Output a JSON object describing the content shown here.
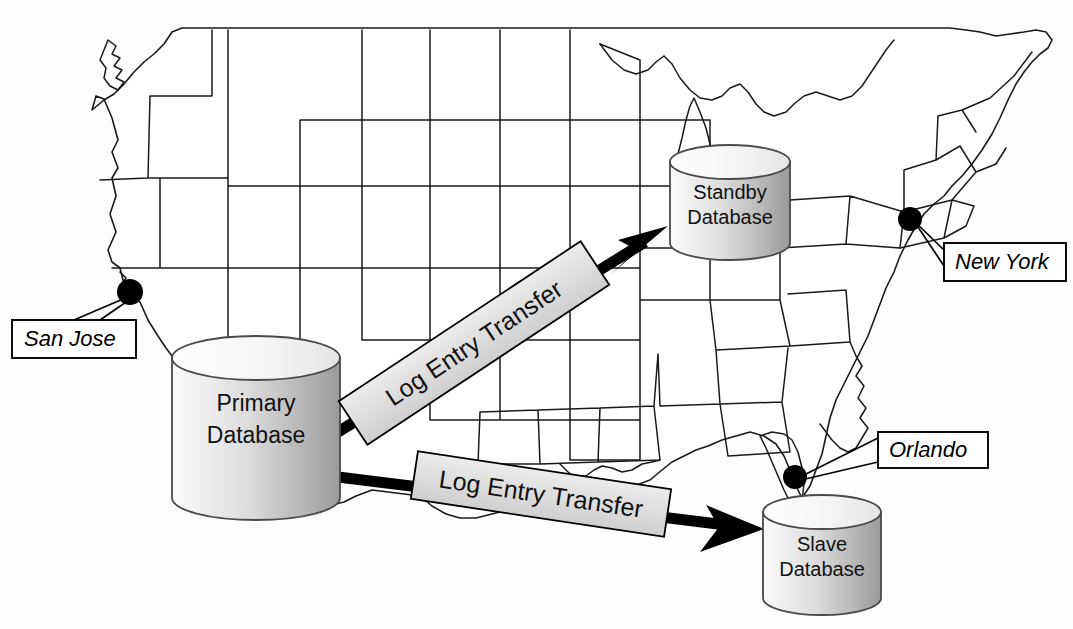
{
  "diagram": {
    "background_color": "#fdfdfd",
    "map_outline_color": "#1a1a1a",
    "accent_color": "#000000"
  },
  "cities": [
    {
      "id": "san-jose",
      "label": "San Jose",
      "dot": {
        "x": 130,
        "y": 292
      },
      "box": {
        "x": 12,
        "y": 320,
        "w": 124,
        "h": 38
      },
      "text": {
        "x": 24,
        "y": 339
      }
    },
    {
      "id": "new-york",
      "label": "New York",
      "dot": {
        "x": 910,
        "y": 219
      },
      "box": {
        "x": 944,
        "y": 243,
        "w": 122,
        "h": 38
      },
      "text": {
        "x": 955,
        "y": 262
      }
    },
    {
      "id": "orlando",
      "label": "Orlando",
      "dot": {
        "x": 795,
        "y": 477
      },
      "box": {
        "x": 878,
        "y": 432,
        "w": 110,
        "h": 36
      },
      "text": {
        "x": 890,
        "y": 450
      }
    }
  ],
  "databases": [
    {
      "id": "primary",
      "line1": "Primary",
      "line2": "Database",
      "cx": 256,
      "top_y": 358,
      "bottom_y": 498,
      "rx": 84,
      "ry": 22,
      "font_size": 25
    },
    {
      "id": "standby",
      "line1": "Standby",
      "line2": "Database",
      "cx": 730,
      "top_y": 162,
      "bottom_y": 243,
      "rx": 60,
      "ry": 17,
      "font_size": 20
    },
    {
      "id": "slave",
      "line1": "Slave",
      "line2": "Database",
      "cx": 822,
      "top_y": 512,
      "bottom_y": 598,
      "rx": 59,
      "ry": 17,
      "font_size": 20
    }
  ],
  "flows": [
    {
      "id": "primary-to-standby",
      "label": "Log Entry Transfer",
      "from": "primary",
      "to": "standby",
      "angle_deg": -33.5,
      "label_center": {
        "x": 474,
        "y": 343
      },
      "label_w": 290,
      "label_h": 52
    },
    {
      "id": "primary-to-slave",
      "label": "Log Entry Transfer",
      "from": "primary",
      "to": "slave",
      "angle_deg": 8.5,
      "label_center": {
        "x": 541,
        "y": 494
      },
      "label_w": 256,
      "label_h": 48
    }
  ],
  "colors": {
    "cylinder_light": "#f7f7f7",
    "cylinder_mid": "#dcdcdc",
    "cylinder_dark": "#9a9a9a",
    "cylinder_top": "#f6f6f6",
    "tag_light": "#e9e9e9",
    "tag_dark": "#cfcfcf",
    "stroke": "#000000"
  }
}
